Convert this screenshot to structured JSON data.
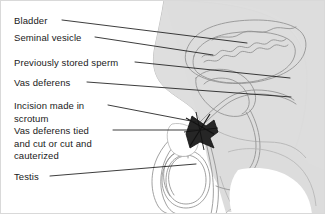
{
  "figure": {
    "kind": "anatomical-illustration",
    "width": 325,
    "height": 214,
    "background_color": "#ffffff",
    "border_color": "#d9d9d9",
    "body_fill_color": "#dcdcdc",
    "body_outline_color": "#b4b4b4",
    "organ_outline_color": "#8c8c8c",
    "cut_marker_color": "#1a1a1a",
    "leader_line_color": "#1a1a1a",
    "text_color": "#1a1a1a"
  },
  "labels": [
    {
      "id": "bladder",
      "lines": [
        "Bladder"
      ],
      "x": 14,
      "y": 15,
      "leader_start_x": 62,
      "leader_start_y": 20,
      "leader_end_x": 247,
      "leader_end_y": 43
    },
    {
      "id": "seminal-vesicle",
      "lines": [
        "Seminal vesicle"
      ],
      "x": 14,
      "y": 32,
      "leader_start_x": 95,
      "leader_start_y": 37,
      "leader_end_x": 213,
      "leader_end_y": 55
    },
    {
      "id": "previously-stored-sperm",
      "lines": [
        "Previously stored sperm"
      ],
      "x": 14,
      "y": 57,
      "leader_start_x": 135,
      "leader_start_y": 62,
      "leader_end_x": 290,
      "leader_end_y": 78
    },
    {
      "id": "vas-deferens",
      "lines": [
        "Vas deferens"
      ],
      "x": 14,
      "y": 77,
      "leader_start_x": 87,
      "leader_start_y": 82,
      "leader_end_x": 291,
      "leader_end_y": 97
    },
    {
      "id": "incision-made-in-scrotum",
      "lines": [
        "Incision made in",
        "scrotum"
      ],
      "x": 14,
      "y": 100,
      "leader_start_x": 108,
      "leader_start_y": 105,
      "leader_end_x": 196,
      "leader_end_y": 122
    },
    {
      "id": "vas-deferens-tied-and-cut",
      "lines": [
        "Vas deferens tied",
        "and cut or cut and",
        "cauterized"
      ],
      "x": 14,
      "y": 125,
      "leader_start_x": 113,
      "leader_start_y": 130,
      "leader_end_x": 200,
      "leader_end_y": 130
    },
    {
      "id": "testis",
      "lines": [
        "Testis"
      ],
      "x": 14,
      "y": 171,
      "leader_start_x": 50,
      "leader_start_y": 176,
      "leader_end_x": 196,
      "leader_end_y": 164
    }
  ],
  "anatomy_parts": [
    "body-outline",
    "bladder-outline",
    "seminal-vesicle-outline",
    "prostate-outline",
    "urethra",
    "vas-deferens-tube",
    "epididymis",
    "testis-oval",
    "scrotum-outline",
    "incision-opening",
    "cut-vas-marker"
  ]
}
